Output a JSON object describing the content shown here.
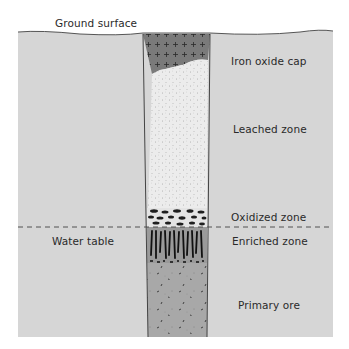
{
  "diagram": {
    "labels": {
      "ground_surface": "Ground surface",
      "iron_oxide_cap": "Iron oxide cap",
      "leached_zone": "Leached zone",
      "oxidized_zone": "Oxidized zone",
      "water_table": "Water table",
      "enriched_zone": "Enriched zone",
      "primary_ore": "Primary ore"
    },
    "colors": {
      "rock": "#d6d6d6",
      "iron_oxide_cap": "#7a7a7a",
      "leached_zone": "#e9e9e9",
      "oxidized_zone": "#e4e4e4",
      "enriched_zone": "#9a9a9a",
      "primary_ore": "#a8a8a8",
      "outline": "#333333",
      "water_table_line": "#444444"
    }
  }
}
